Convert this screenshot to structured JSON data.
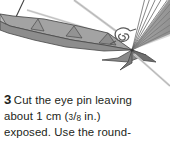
{
  "page": {
    "background_color": "#ffffff",
    "text_color": "#231f20"
  },
  "illustration": {
    "name": "eye-pin-wire-craft-diagram",
    "description": "Grayscale line-art of a folded angular form with a radiating fan at right, a coiled wire eye-pin loop, and thin straight wire shafts",
    "colors": {
      "fill_light": "#b4b4b4",
      "fill_mid": "#9c9c9c",
      "fill_dark": "#8a8a8a",
      "fill_darker": "#6f6f6f",
      "outline": "#4a4a4a",
      "wire_light": "#c8c8c8",
      "wire_dark": "#6a6a6a"
    },
    "parts": [
      {
        "name": "folded-gray-band",
        "label": "folded angular band"
      },
      {
        "name": "radiating-fan",
        "label": "radiating fan of lines"
      },
      {
        "name": "eye-pin-loop",
        "label": "coiled eye pin loop"
      },
      {
        "name": "wire-shaft-upper",
        "label": "upper wire shaft"
      },
      {
        "name": "wire-shaft-lower",
        "label": "lower wire shaft"
      },
      {
        "name": "pointer-line",
        "label": "thin pointer line"
      }
    ]
  },
  "caption": {
    "step_number": "3",
    "line1_text": "Cut the eye pin leaving",
    "line2_prefix": "about 1 cm (",
    "line2_fraction_numerator": "3",
    "line2_fraction_slash": "/",
    "line2_fraction_denominator": "8",
    "line2_suffix": " in.)",
    "line3_text": "exposed. Use the round-",
    "full_text": "3 Cut the eye pin leaving about 1 cm (3/8 in.) exposed. Use the round-"
  }
}
